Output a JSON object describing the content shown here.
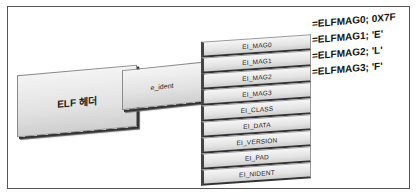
{
  "diagram": {
    "elf_header_label": "ELF 헤더",
    "e_ident_label": "e_ident",
    "fields": [
      {
        "label": "EI_MAG0"
      },
      {
        "label": "EI_MAG1"
      },
      {
        "label": "EI_MAG2"
      },
      {
        "label": "EI_MAG3"
      },
      {
        "label": "EI_CLASS"
      },
      {
        "label": "EI_DATA"
      },
      {
        "label": "EI_VERSION"
      },
      {
        "label": "EI_PAD"
      },
      {
        "label": "EI_NIDENT"
      }
    ],
    "annotations": [
      {
        "text": "=ELFMAG0; 0X7F"
      },
      {
        "text": "=ELFMAG1; 'E'"
      },
      {
        "text": "=ELFMAG2; 'L'"
      },
      {
        "text": "=ELFMAG3; 'F'"
      }
    ]
  }
}
